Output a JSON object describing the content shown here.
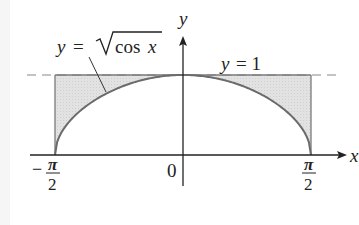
{
  "diagram": {
    "curve_label": {
      "y": "y",
      "eq": "=",
      "expr": "cos x",
      "cos": "cos",
      "x": "x"
    },
    "line_label": {
      "y": "y",
      "eq": "= 1"
    },
    "axis_labels": {
      "x": "x",
      "y": "y"
    },
    "ticks": {
      "origin": "0",
      "left": {
        "sign": "−",
        "num": "π",
        "den": "2"
      },
      "right": {
        "num": "π",
        "den": "2"
      }
    },
    "colors": {
      "curve": "#6b6b6b",
      "shade": "#dcdcdc",
      "axis": "#222222",
      "dashed": "#777777"
    }
  },
  "chart_data": {
    "type": "area",
    "title": "",
    "curves": [
      {
        "name": "y = sqrt(cos x)",
        "function": "sqrt(cos(x))",
        "domain": [
          "-pi/2",
          "pi/2"
        ]
      },
      {
        "name": "y = 1",
        "function": "1",
        "style": "dashed"
      }
    ],
    "shaded_region": "between y = 1 and y = sqrt(cos x) for -pi/2 <= x <= pi/2",
    "xticks": [
      "-π/2",
      "0",
      "π/2"
    ],
    "xlabel": "x",
    "ylabel": "y",
    "xlim": [
      "-pi/2",
      "pi/2"
    ],
    "ylim": [
      0,
      1
    ]
  }
}
